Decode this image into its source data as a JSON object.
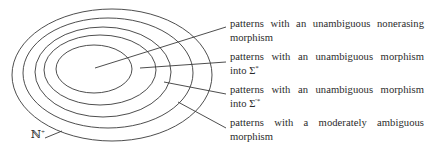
{
  "diagram": {
    "type": "nested-sets",
    "stroke_color": "#3a3a3a",
    "ellipses": [
      {
        "name": "outer-set",
        "cx": 112,
        "cy": 75,
        "rx": 100,
        "ry": 66
      },
      {
        "name": "set-2",
        "cx": 108,
        "cy": 73,
        "rx": 85,
        "ry": 55
      },
      {
        "name": "set-3",
        "cx": 103,
        "cy": 72,
        "rx": 68,
        "ry": 45
      },
      {
        "name": "set-4",
        "cx": 100,
        "cy": 70,
        "rx": 56,
        "ry": 35
      },
      {
        "name": "inner-set",
        "cx": 94,
        "cy": 69,
        "rx": 38,
        "ry": 24
      }
    ],
    "universe_label": {
      "base": "ℕ",
      "sup": "+"
    },
    "labels": [
      {
        "line1": "patterns with an unambiguous nonerasing",
        "line2": "morphism",
        "sup": ""
      },
      {
        "line1": "patterns with an unambiguous morphism",
        "line2": "into Σ",
        "sup": "*"
      },
      {
        "line1": "patterns with an unambiguous morphism",
        "line2": "into Σ",
        "sup": "′*"
      },
      {
        "line1": "patterns with a moderately ambiguous",
        "line2": "morphism",
        "sup": ""
      }
    ]
  }
}
